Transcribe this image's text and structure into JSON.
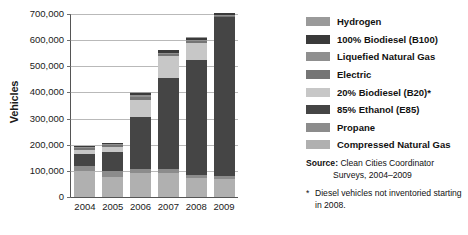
{
  "chart_data": {
    "type": "bar",
    "stacked": true,
    "title": "",
    "xlabel": "",
    "ylabel": "Vehicles",
    "categories": [
      "2004",
      "2005",
      "2006",
      "2007",
      "2008",
      "2009"
    ],
    "ylim": [
      0,
      700000
    ],
    "ytick_labels": [
      "700,000",
      "600,000",
      "500,000",
      "400,000",
      "300,000",
      "200,000",
      "100,000",
      "0"
    ],
    "ytick_values": [
      700000,
      600000,
      500000,
      400000,
      300000,
      200000,
      100000,
      0
    ],
    "ytick_step": 100000,
    "grid": true,
    "legend_position": "right",
    "series": [
      {
        "name": "Compressed Natural Gas",
        "color": "#b0b0b0",
        "values": [
          98000,
          78000,
          92000,
          92000,
          74000,
          70000
        ]
      },
      {
        "name": "Propane",
        "color": "#8c8c8c",
        "values": [
          22000,
          22000,
          17000,
          14000,
          12000,
          11000
        ]
      },
      {
        "name": "85% Ethanol (E85)",
        "color": "#454545",
        "values": [
          46000,
          72000,
          197000,
          348000,
          440000,
          608000
        ]
      },
      {
        "name": "20% Biodiesel (B20)*",
        "color": "#c7c7c7",
        "values": [
          14000,
          20000,
          66000,
          86000,
          62000,
          0
        ]
      },
      {
        "name": "Electric",
        "color": "#757575",
        "values": [
          7000,
          6000,
          12000,
          8000,
          9000,
          4000
        ]
      },
      {
        "name": "Liquefied Natural Gas",
        "color": "#8f8f8f",
        "values": [
          3000,
          3000,
          5000,
          4000,
          4000,
          3000
        ]
      },
      {
        "name": "100% Biodiesel (B100)",
        "color": "#3a3a3a",
        "values": [
          5000,
          4000,
          9000,
          9000,
          9000,
          7000
        ]
      },
      {
        "name": "Hydrogen",
        "color": "#9a9a9a",
        "values": [
          1000,
          1000,
          2000,
          2000,
          2000,
          2000
        ]
      }
    ],
    "totals": [
      196000,
      206000,
      400000,
      563000,
      612000,
      705000
    ]
  },
  "axis": {
    "ylabel": "Vehicles",
    "yticks": [
      "700,000",
      "600,000",
      "500,000",
      "400,000",
      "300,000",
      "200,000",
      "100,000",
      "0"
    ],
    "xticks": [
      "2004",
      "2005",
      "2006",
      "2007",
      "2008",
      "2009"
    ]
  },
  "legend": {
    "items": [
      {
        "label": "Hydrogen",
        "color": "#9a9a9a"
      },
      {
        "label": "100% Biodiesel (B100)",
        "color": "#3a3a3a"
      },
      {
        "label": "Liquefied Natural Gas",
        "color": "#8f8f8f"
      },
      {
        "label": "Electric",
        "color": "#757575"
      },
      {
        "label": "20% Biodiesel (B20)*",
        "color": "#c7c7c7"
      },
      {
        "label": "85% Ethanol (E85)",
        "color": "#454545"
      },
      {
        "label": "Propane",
        "color": "#8c8c8c"
      },
      {
        "label": "Compressed Natural Gas",
        "color": "#b0b0b0"
      }
    ]
  },
  "notes": {
    "source_label": "Source:",
    "source_line1": "Clean Cities Coordinator",
    "source_line2": "Surveys, 2004–2009",
    "footnote_marker": "*",
    "footnote_text": "Diesel vehicles not inventoried starting in 2008."
  }
}
